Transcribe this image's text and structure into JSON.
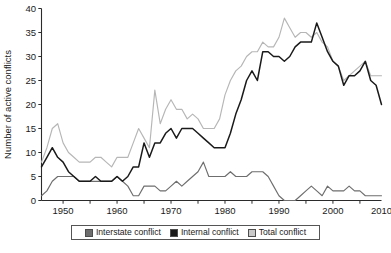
{
  "chart_data": {
    "type": "line",
    "title": "",
    "xlabel": "",
    "ylabel": "Number of active conflicts",
    "xlim": [
      1946,
      2009
    ],
    "ylim": [
      0,
      40
    ],
    "ytick_values": [
      0,
      5,
      10,
      15,
      20,
      25,
      30,
      35,
      40
    ],
    "ytick_labels": [
      "0",
      "5",
      "10",
      "15",
      "20",
      "25",
      "30",
      "35",
      "40"
    ],
    "xtick_labels": [
      "1950",
      "1960",
      "1970",
      "1980",
      "1990",
      "2000",
      "2010"
    ],
    "xtick_values": [
      1950,
      1960,
      1970,
      1980,
      1990,
      2000,
      2010
    ],
    "xminor_step": 5,
    "grid": false,
    "legend_position": "bottom-center",
    "x": [
      1946,
      1947,
      1948,
      1949,
      1950,
      1951,
      1952,
      1953,
      1954,
      1955,
      1956,
      1957,
      1958,
      1959,
      1960,
      1961,
      1962,
      1963,
      1964,
      1965,
      1966,
      1967,
      1968,
      1969,
      1970,
      1971,
      1972,
      1973,
      1974,
      1975,
      1976,
      1977,
      1978,
      1979,
      1980,
      1981,
      1982,
      1983,
      1984,
      1985,
      1986,
      1987,
      1988,
      1989,
      1990,
      1991,
      1992,
      1993,
      1994,
      1995,
      1996,
      1997,
      1998,
      1999,
      2000,
      2001,
      2002,
      2003,
      2004,
      2005,
      2006,
      2007,
      2008,
      2009
    ],
    "series": [
      {
        "name": "Interstate conflict",
        "color": "#6e6e6e",
        "values": [
          1,
          2,
          4,
          5,
          5,
          5,
          5,
          4,
          4,
          4,
          4,
          4,
          4,
          4,
          5,
          4,
          3,
          1,
          1,
          3,
          3,
          3,
          2,
          2,
          3,
          4,
          3,
          4,
          5,
          6,
          8,
          5,
          5,
          5,
          5,
          6,
          5,
          5,
          5,
          6,
          6,
          6,
          5,
          3,
          1,
          0,
          0,
          0,
          1,
          2,
          3,
          2,
          1,
          3,
          2,
          2,
          2,
          3,
          2,
          2,
          1,
          1,
          1,
          1
        ]
      },
      {
        "name": "Internal conflict",
        "color": "#1a1a1a",
        "values": [
          7,
          9,
          11,
          9,
          8,
          6,
          5,
          4,
          4,
          4,
          5,
          4,
          4,
          4,
          5,
          4,
          5,
          7,
          7,
          12,
          9,
          12,
          12,
          14,
          15,
          13,
          15,
          15,
          15,
          14,
          13,
          12,
          11,
          11,
          11,
          14,
          18,
          21,
          25,
          27,
          25,
          31,
          31,
          30,
          30,
          29,
          30,
          32,
          33,
          33,
          33,
          37,
          34,
          31,
          29,
          28,
          24,
          26,
          26,
          27,
          29,
          25,
          24,
          20
        ]
      },
      {
        "name": "Total conflict",
        "color": "#b6b6b6",
        "values": [
          8,
          11,
          15,
          16,
          12,
          10,
          9,
          8,
          8,
          8,
          9,
          9,
          8,
          7,
          9,
          9,
          9,
          12,
          15,
          13,
          11,
          23,
          16,
          19,
          21,
          19,
          19,
          17,
          18,
          17,
          15,
          15,
          15,
          17,
          22,
          25,
          27,
          28,
          30,
          31,
          31,
          33,
          32,
          32,
          34,
          38,
          36,
          34,
          35,
          35,
          34,
          35,
          33,
          32,
          29,
          28,
          25,
          26,
          27,
          28,
          29,
          26,
          26,
          26
        ]
      }
    ]
  },
  "legend": {
    "entries": [
      {
        "label": "Interstate conflict",
        "color": "#6e6e6e"
      },
      {
        "label": "Internal conflict",
        "color": "#1a1a1a"
      },
      {
        "label": "Total conflict",
        "color": "#c9c9c9"
      }
    ]
  },
  "axes": {
    "y_title": "Number of active conflicts"
  }
}
